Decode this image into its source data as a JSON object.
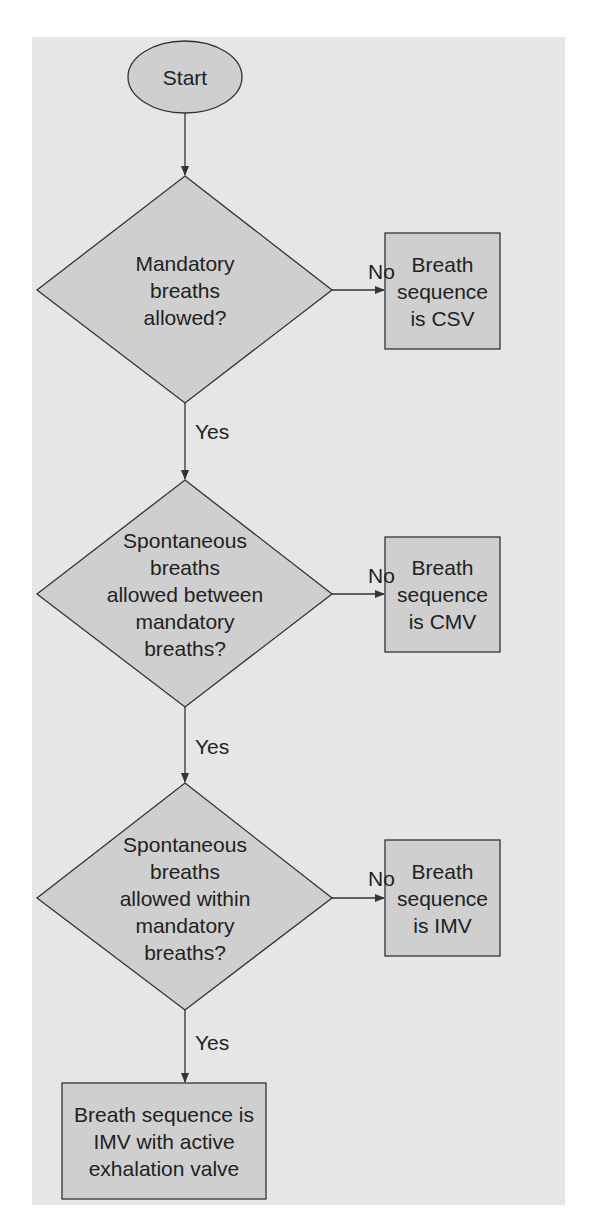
{
  "diagram": {
    "type": "flowchart",
    "colors": {
      "panel": "#e6e6e6",
      "node_fill": "#cfcfcf",
      "stroke": "#333333",
      "text": "#222222"
    },
    "nodes": {
      "start": {
        "shape": "ellipse",
        "label": "Start"
      },
      "d1": {
        "shape": "diamond",
        "lines": [
          "Mandatory",
          "breaths",
          "allowed?"
        ]
      },
      "csv": {
        "shape": "rect",
        "lines": [
          "Breath",
          "sequence",
          "is CSV"
        ]
      },
      "d2": {
        "shape": "diamond",
        "lines": [
          "Spontaneous",
          "breaths",
          "allowed between",
          "mandatory",
          "breaths?"
        ]
      },
      "cmv": {
        "shape": "rect",
        "lines": [
          "Breath",
          "sequence",
          "is CMV"
        ]
      },
      "d3": {
        "shape": "diamond",
        "lines": [
          "Spontaneous",
          "breaths",
          "allowed within",
          "mandatory",
          "breaths?"
        ]
      },
      "imv": {
        "shape": "rect",
        "lines": [
          "Breath",
          "sequence",
          "is IMV"
        ]
      },
      "final": {
        "shape": "rect",
        "lines": [
          "Breath sequence is",
          "IMV with active",
          "exhalation valve"
        ]
      }
    },
    "edges": [
      {
        "from": "start",
        "to": "d1",
        "label": ""
      },
      {
        "from": "d1",
        "to": "csv",
        "label": "No"
      },
      {
        "from": "d1",
        "to": "d2",
        "label": "Yes"
      },
      {
        "from": "d2",
        "to": "cmv",
        "label": "No"
      },
      {
        "from": "d2",
        "to": "d3",
        "label": "Yes"
      },
      {
        "from": "d3",
        "to": "imv",
        "label": "No"
      },
      {
        "from": "d3",
        "to": "final",
        "label": "Yes"
      }
    ]
  }
}
